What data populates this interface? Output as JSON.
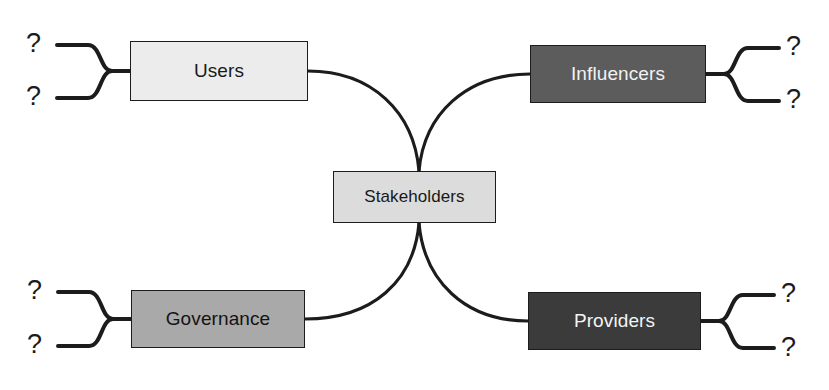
{
  "diagram": {
    "background_color": "#ffffff",
    "line_color": "#1c1c1c",
    "center": {
      "label": "Stakeholders",
      "fill": "#dcdcdc",
      "text_color": "#181818"
    },
    "branches": [
      {
        "id": "users",
        "label": "Users",
        "position": "top-left",
        "fill": "#ececec",
        "text_color": "#1a1a1a",
        "leaves": [
          "?",
          "?"
        ]
      },
      {
        "id": "influencers",
        "label": "Influencers",
        "position": "top-right",
        "fill": "#5c5c5c",
        "text_color": "#f2f2f2",
        "leaves": [
          "?",
          "?"
        ]
      },
      {
        "id": "governance",
        "label": "Governance",
        "position": "bottom-left",
        "fill": "#a9a9a9",
        "text_color": "#131313",
        "leaves": [
          "?",
          "?"
        ]
      },
      {
        "id": "providers",
        "label": "Providers",
        "position": "bottom-right",
        "fill": "#3b3b3b",
        "text_color": "#f4f4f4",
        "leaves": [
          "?",
          "?"
        ]
      }
    ]
  }
}
